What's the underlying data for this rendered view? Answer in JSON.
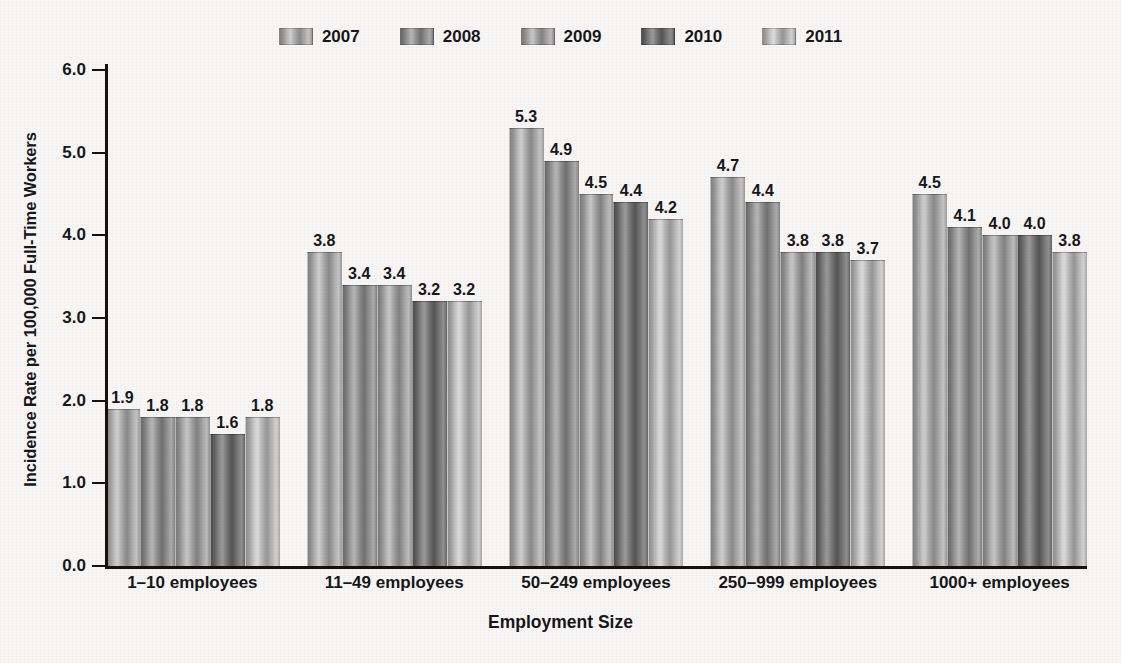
{
  "chart_data": {
    "type": "bar",
    "title": "",
    "xlabel": "Employment Size",
    "ylabel": "Incidence Rate per 100,000 Full-Time Workers",
    "categories": [
      "1–10 employees",
      "11–49 employees",
      "50–249 employees",
      "250–999 employees",
      "1000+ employees"
    ],
    "series": [
      {
        "name": "2007",
        "values": [
          1.9,
          3.8,
          5.3,
          4.7,
          4.5
        ]
      },
      {
        "name": "2008",
        "values": [
          1.8,
          3.4,
          4.9,
          4.4,
          4.1
        ]
      },
      {
        "name": "2009",
        "values": [
          1.8,
          3.4,
          4.5,
          3.8,
          4.0
        ]
      },
      {
        "name": "2010",
        "values": [
          1.6,
          3.2,
          4.4,
          3.8,
          4.0
        ]
      },
      {
        "name": "2011",
        "values": [
          1.8,
          3.2,
          4.2,
          3.7,
          3.8
        ]
      }
    ],
    "value_labels": [
      [
        "1.9",
        "1.8",
        "1.8",
        "1.6",
        "1.8"
      ],
      [
        "3.8",
        "3.4",
        "3.4",
        "3.2",
        "3.2"
      ],
      [
        "5.3",
        "4.9",
        "4.5",
        "4.4",
        "4.2"
      ],
      [
        "4.7",
        "4.4",
        "3.8",
        "3.8",
        "3.7"
      ],
      [
        "4.5",
        "4.1",
        "4.0",
        "4.0",
        "3.8"
      ]
    ],
    "ylim": [
      0.0,
      6.0
    ],
    "ytick_labels": [
      "6.0",
      "5.0",
      "4.0",
      "3.0",
      "2.0",
      "1.0",
      "0.0"
    ],
    "ytick_values": [
      6.0,
      5.0,
      4.0,
      3.0,
      2.0,
      1.0,
      0.0
    ],
    "grid": false,
    "legend_position": "top-center",
    "series_colors": [
      "#a3a3a3",
      "#8a8a8a",
      "#9b9b9b",
      "#6e6e6e",
      "#b0b0b0"
    ]
  },
  "legend": {
    "items": [
      {
        "label": "2007"
      },
      {
        "label": "2008"
      },
      {
        "label": "2009"
      },
      {
        "label": "2010"
      },
      {
        "label": "2011"
      }
    ]
  },
  "axes": {
    "y_title": "Incidence Rate per 100,000 Full-Time Workers",
    "x_title": "Employment Size"
  },
  "background_bleed": {
    "top": "",
    "mid": "",
    "bottom": "",
    "left": ""
  }
}
